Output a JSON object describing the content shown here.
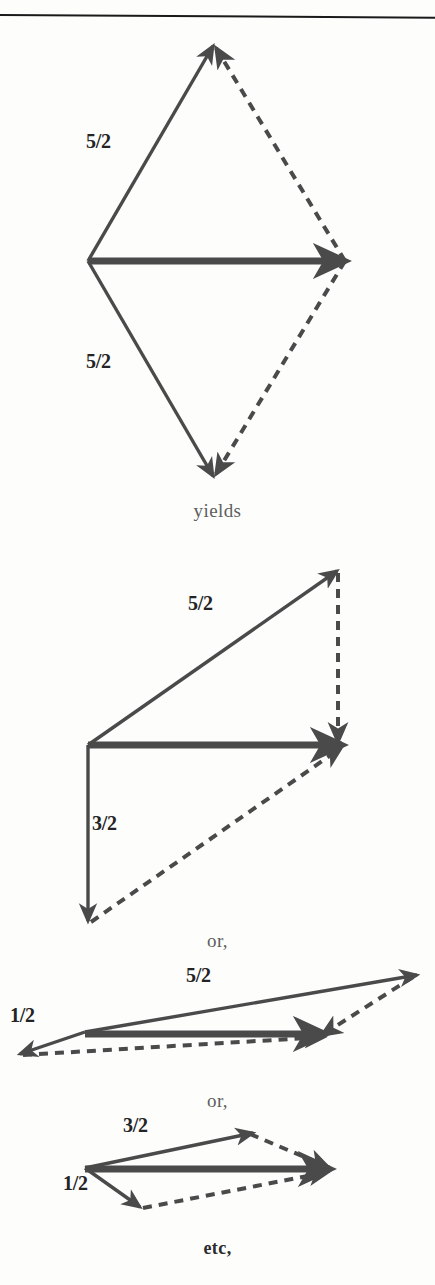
{
  "page": {
    "background": "#fdfdfc",
    "ink_color": "#4a4a4a",
    "text_color": "#242424",
    "width": 435,
    "height": 1285,
    "rule_color": "#1a1a1a"
  },
  "connectors": [
    {
      "id": "yields",
      "text": "yields",
      "y": 500
    },
    {
      "id": "or-1",
      "text": "or,",
      "y": 930
    },
    {
      "id": "or-2",
      "text": "or,",
      "y": 1090
    },
    {
      "id": "etc",
      "text": "etc,",
      "y": 1238,
      "bold": true
    }
  ],
  "figures": [
    {
      "id": "figure-1",
      "name": "rhombus-vector-sum",
      "labels": [
        {
          "id": "fig1-label-upper",
          "text": "5/2",
          "x": 86,
          "y": 130
        },
        {
          "id": "fig1-label-lower",
          "text": "5/2",
          "x": 86,
          "y": 350
        }
      ],
      "solid_vectors": [
        {
          "id": "fig1-up-left",
          "from": [
            88,
            261
          ],
          "to": [
            213,
            46
          ]
        },
        {
          "id": "fig1-down-left",
          "from": [
            88,
            261
          ],
          "to": [
            213,
            476
          ]
        },
        {
          "id": "fig1-resultant-horizontal",
          "from": [
            88,
            261
          ],
          "to": [
            345,
            261
          ],
          "thick": true
        }
      ],
      "dashed_vectors": [
        {
          "id": "fig1-dashed-upper-right",
          "from": [
            345,
            261
          ],
          "to": [
            216,
            48
          ]
        },
        {
          "id": "fig1-dashed-lower-right",
          "from": [
            345,
            261
          ],
          "to": [
            216,
            474
          ]
        }
      ]
    },
    {
      "id": "figure-2",
      "name": "right-triangle-vector-sum",
      "labels": [
        {
          "id": "fig2-label-diagonal",
          "text": "5/2",
          "x": 188,
          "y": 592
        },
        {
          "id": "fig2-label-vertical",
          "text": "3/2",
          "x": 92,
          "y": 812
        }
      ],
      "solid_vectors": [
        {
          "id": "fig2-diagonal",
          "from": [
            88,
            745
          ],
          "to": [
            337,
            571
          ]
        },
        {
          "id": "fig2-vertical-down",
          "from": [
            88,
            745
          ],
          "to": [
            88,
            921
          ]
        },
        {
          "id": "fig2-resultant-horizontal",
          "from": [
            88,
            745
          ],
          "to": [
            342,
            745
          ],
          "thick": true
        }
      ],
      "dashed_vectors": [
        {
          "id": "fig2-dashed-vertical-right",
          "from": [
            338,
            573
          ],
          "to": [
            338,
            742
          ]
        },
        {
          "id": "fig2-dashed-diagonal",
          "from": [
            91,
            922
          ],
          "to": [
            341,
            748
          ]
        }
      ]
    },
    {
      "id": "figure-3",
      "name": "shallow-parallelogram-vector-sum",
      "labels": [
        {
          "id": "fig3-label-upper",
          "text": "5/2",
          "x": 186,
          "y": 964
        },
        {
          "id": "fig3-label-lower",
          "text": "1/2",
          "x": 10,
          "y": 1004
        }
      ],
      "solid_vectors": [
        {
          "id": "fig3-diagonal-up",
          "from": [
            85,
            1032
          ],
          "to": [
            417,
            975
          ]
        },
        {
          "id": "fig3-short-down-left",
          "from": [
            85,
            1032
          ],
          "to": [
            20,
            1054
          ]
        },
        {
          "id": "fig3-resultant-horizontal",
          "from": [
            85,
            1034
          ],
          "to": [
            325,
            1034
          ],
          "thick": true
        }
      ],
      "dashed_vectors": [
        {
          "id": "fig3-dashed-right",
          "from": [
            413,
            977
          ],
          "to": [
            322,
            1035
          ]
        },
        {
          "id": "fig3-dashed-bottom",
          "from": [
            23,
            1055
          ],
          "to": [
            324,
            1037
          ]
        }
      ]
    },
    {
      "id": "figure-4",
      "name": "flat-parallelogram-vector-sum",
      "labels": [
        {
          "id": "fig4-label-upper",
          "text": "3/2",
          "x": 123,
          "y": 1114
        },
        {
          "id": "fig4-label-lower",
          "text": "1/2",
          "x": 63,
          "y": 1172
        }
      ],
      "solid_vectors": [
        {
          "id": "fig4-diagonal-up",
          "from": [
            85,
            1168
          ],
          "to": [
            253,
            1133
          ]
        },
        {
          "id": "fig4-short-down-right",
          "from": [
            85,
            1168
          ],
          "to": [
            140,
            1207
          ]
        },
        {
          "id": "fig4-resultant-horizontal",
          "from": [
            85,
            1169
          ],
          "to": [
            330,
            1169
          ],
          "thick": true
        }
      ],
      "dashed_vectors": [
        {
          "id": "fig4-dashed-upper-right",
          "from": [
            250,
            1134
          ],
          "to": [
            328,
            1167
          ]
        },
        {
          "id": "fig4-dashed-lower-right",
          "from": [
            143,
            1208
          ],
          "to": [
            328,
            1172
          ]
        }
      ]
    }
  ]
}
